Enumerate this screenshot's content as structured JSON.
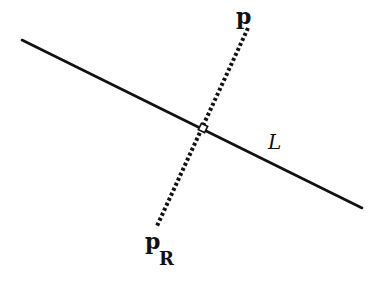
{
  "diagram": {
    "labels": {
      "point": "p",
      "reflected_point_base": "p",
      "reflected_point_subscript": "R",
      "line": "L"
    },
    "colors": {
      "background": "#ffffff",
      "ink": "#111111"
    },
    "geometry": {
      "line_L": {
        "x1": 22,
        "y1": 40,
        "x2": 362,
        "y2": 208,
        "style": "solid"
      },
      "segment_p_pR": {
        "x1": 248,
        "y1": 28,
        "x2": 157,
        "y2": 226,
        "style": "dotted"
      },
      "intersection": {
        "x": 203,
        "y": 128,
        "marker": "small-square"
      }
    }
  }
}
